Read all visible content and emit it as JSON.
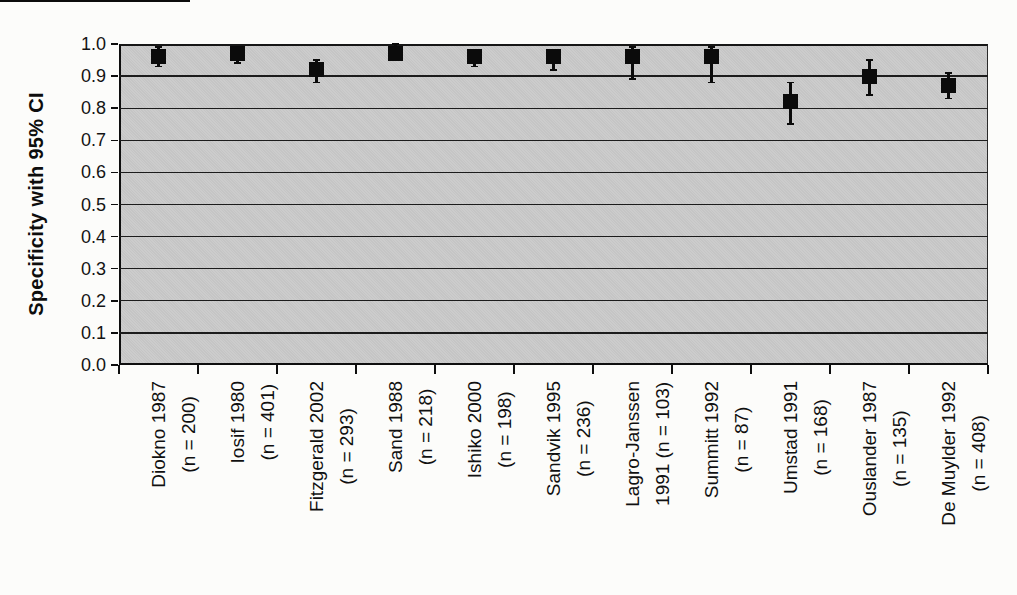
{
  "figure": {
    "background": "#fcfcfa",
    "plot_background": "#c9c9c9",
    "line_color": "#1a1a1a",
    "marker_color": "#0b0b0b",
    "marker_shape": "filled-square",
    "scan_artifact": "black strip top-left edge"
  },
  "chart_data": {
    "type": "scatter",
    "title": "",
    "xlabel": "",
    "ylabel": "Specificity with 95% CI",
    "ylim": [
      0.0,
      1.0
    ],
    "ytick_labels": [
      "0.0",
      "0.1",
      "0.2",
      "0.3",
      "0.4",
      "0.5",
      "0.6",
      "0.7",
      "0.8",
      "0.9",
      "1.0"
    ],
    "grid": "horizontal gridlines every 0.1",
    "legend_position": "none",
    "marker": "black square with vertical 95% CI error bars",
    "categories": [
      "Diokno 1987 (n = 200)",
      "Iosif 1980 (n = 401)",
      "Fitzgerald 2002 (n = 293)",
      "Sand 1988 (n = 218)",
      "Ishiko 2000 (n = 198)",
      "Sandvik 1995 (n = 236)",
      "Lagro-Janssen 1991 (n = 103)",
      "Summitt 1992 (n = 87)",
      "Umstad 1991 (n = 168)",
      "Ouslander 1987 (n = 135)",
      "De Muylder 1992 (n = 408)"
    ],
    "series": [
      {
        "name": "Specificity",
        "points": [
          {
            "label_line1": "Diokno 1987",
            "label_line2": "(n = 200)",
            "study": "Diokno",
            "year": "1987",
            "n": 200,
            "value": 0.96,
            "ci_low": 0.93,
            "ci_high": 0.99
          },
          {
            "label_line1": "Iosif 1980",
            "label_line2": "(n = 401)",
            "study": "Iosif",
            "year": "1980",
            "n": 401,
            "value": 0.97,
            "ci_low": 0.94,
            "ci_high": 0.99
          },
          {
            "label_line1": "Fitzgerald 2002",
            "label_line2": "(n = 293)",
            "study": "Fitzgerald",
            "year": "2002",
            "n": 293,
            "value": 0.92,
            "ci_low": 0.88,
            "ci_high": 0.95
          },
          {
            "label_line1": "Sand 1988",
            "label_line2": "(n = 218)",
            "study": "Sand",
            "year": "1988",
            "n": 218,
            "value": 0.97,
            "ci_low": 0.95,
            "ci_high": 1.0
          },
          {
            "label_line1": "Ishiko 2000",
            "label_line2": "(n = 198)",
            "study": "Ishiko",
            "year": "2000",
            "n": 198,
            "value": 0.96,
            "ci_low": 0.93,
            "ci_high": 0.98
          },
          {
            "label_line1": "Sandvik 1995",
            "label_line2": "(n = 236)",
            "study": "Sandvik",
            "year": "1995",
            "n": 236,
            "value": 0.96,
            "ci_low": 0.92,
            "ci_high": 0.98
          },
          {
            "label_line1": "Lagro-Janssen",
            "label_line2": "1991 (n = 103)",
            "study": "Lagro-Janssen",
            "year": "1991",
            "n": 103,
            "value": 0.96,
            "ci_low": 0.89,
            "ci_high": 0.99
          },
          {
            "label_line1": "Summitt 1992",
            "label_line2": "(n = 87)",
            "study": "Summitt",
            "year": "1992",
            "n": 87,
            "value": 0.96,
            "ci_low": 0.88,
            "ci_high": 0.99
          },
          {
            "label_line1": "Umstad 1991",
            "label_line2": "(n = 168)",
            "study": "Umstad",
            "year": "1991",
            "n": 168,
            "value": 0.82,
            "ci_low": 0.75,
            "ci_high": 0.88
          },
          {
            "label_line1": "Ouslander 1987",
            "label_line2": "(n = 135)",
            "study": "Ouslander",
            "year": "1987",
            "n": 135,
            "value": 0.9,
            "ci_low": 0.84,
            "ci_high": 0.95
          },
          {
            "label_line1": "De Muylder 1992",
            "label_line2": "(n = 408)",
            "study": "De Muylder",
            "year": "1992",
            "n": 408,
            "value": 0.87,
            "ci_low": 0.83,
            "ci_high": 0.91
          }
        ]
      }
    ]
  }
}
